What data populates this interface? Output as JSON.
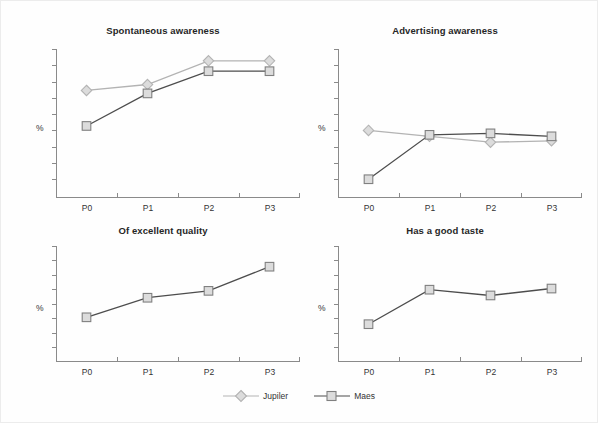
{
  "figure": {
    "background_color": "#fefefe",
    "border_color": "#ececec",
    "axis_color": "#8a8a8a"
  },
  "legend": {
    "position": "bottom-center",
    "entries": [
      {
        "name": "Jupiler",
        "marker": "diamond",
        "line_color": "#b3b3b3",
        "fill_color": "#dcdcdc",
        "edge_color": "#b3b3b3"
      },
      {
        "name": "Maes",
        "marker": "square",
        "line_color": "#4d4d4d",
        "fill_color": "#dcdcdc",
        "edge_color": "#808080"
      }
    ]
  },
  "chart_data": [
    {
      "type": "line",
      "title": "Spontaneous awareness",
      "xlabel": "",
      "ylabel": "%",
      "categories": [
        "P0",
        "P1",
        "P2",
        "P3"
      ],
      "ytick_count": 9,
      "ylim": [
        0,
        100
      ],
      "grid": false,
      "series": [
        {
          "name": "Jupiler",
          "values": [
            72,
            76,
            92,
            92
          ]
        },
        {
          "name": "Maes",
          "values": [
            48,
            70,
            85,
            85
          ]
        }
      ]
    },
    {
      "type": "line",
      "title": "Advertising awareness",
      "xlabel": "",
      "ylabel": "%",
      "categories": [
        "P0",
        "P1",
        "P2",
        "P3"
      ],
      "ytick_count": 9,
      "ylim": [
        0,
        100
      ],
      "grid": false,
      "series": [
        {
          "name": "Jupiler",
          "values": [
            45,
            41,
            37,
            38
          ]
        },
        {
          "name": "Maes",
          "values": [
            12,
            42,
            43,
            41
          ]
        }
      ]
    },
    {
      "type": "line",
      "title": "Of excellent quality",
      "xlabel": "",
      "ylabel": "%",
      "categories": [
        "P0",
        "P1",
        "P2",
        "P3"
      ],
      "ytick_count": 8,
      "ylim": [
        0,
        100
      ],
      "grid": false,
      "series": [
        {
          "name": "Maes",
          "values": [
            38,
            55,
            61,
            82
          ]
        }
      ]
    },
    {
      "type": "line",
      "title": "Has a good taste",
      "xlabel": "",
      "ylabel": "%",
      "categories": [
        "P0",
        "P1",
        "P2",
        "P3"
      ],
      "ytick_count": 8,
      "ylim": [
        0,
        100
      ],
      "grid": false,
      "series": [
        {
          "name": "Maes",
          "values": [
            32,
            62,
            57,
            63
          ]
        }
      ]
    }
  ]
}
